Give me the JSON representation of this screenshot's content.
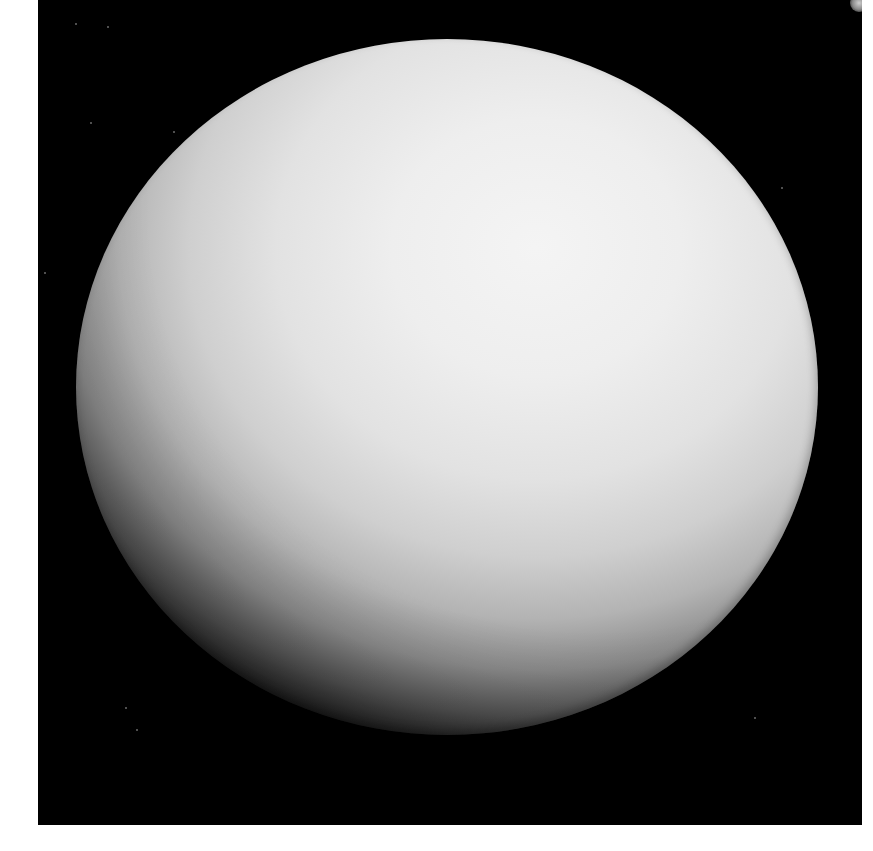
{
  "image": {
    "subject": "Planet photographed against black space",
    "description": "A large, featureless, pale grey-white planetary disk, brightest toward the upper right and shading darker toward the lower-left limb, on a black background with a thin white border",
    "colors": {
      "page_background": "#ffffff",
      "space": "#000000",
      "planet_highlight": "#f4f4f4",
      "planet_midtone": "#cfcfcf",
      "planet_limb": "#1c1c1c"
    }
  }
}
